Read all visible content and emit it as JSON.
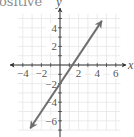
{
  "caption": "ositive",
  "chart_data": {
    "type": "line",
    "title": "",
    "xlabel": "x",
    "ylabel": "y",
    "xlim": [
      -4.5,
      6.5
    ],
    "ylim": [
      -7,
      5.5
    ],
    "grid": true,
    "x_ticks": [
      -4,
      -2,
      2,
      4,
      6
    ],
    "y_ticks": [
      4,
      2,
      -2,
      -4,
      -6
    ],
    "x_tick_labels": [
      "−4",
      "−2",
      "2",
      "4",
      "6"
    ],
    "y_tick_labels": [
      "4",
      "2",
      "−2",
      "−4",
      "−6"
    ],
    "series": [
      {
        "name": "line",
        "equation": "y = 1.5x - 2",
        "slope": 1.5,
        "intercept": -2,
        "x": [
          -3.2,
          4.5
        ],
        "y": [
          -6.8,
          4.75
        ],
        "arrows": "both",
        "color": "#6e6e6e"
      }
    ],
    "annotations": []
  },
  "colors": {
    "axis": "#333333",
    "grid": "#e6e6e6",
    "text": "#555555",
    "line": "#6e6e6e"
  }
}
